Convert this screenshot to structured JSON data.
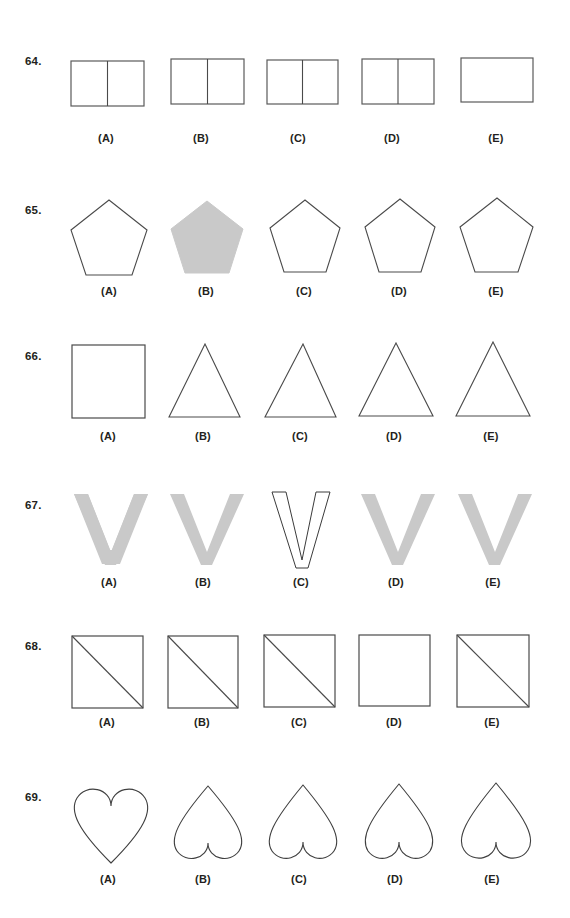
{
  "page": {
    "background_color": "#ffffff",
    "ink_color": "#3a3a3a",
    "fill_gray": "#c9c9c9",
    "text_color": "#231f20",
    "option_labels": [
      "(A)",
      "(B)",
      "(C)",
      "(D)",
      "(E)"
    ]
  },
  "rows": [
    {
      "number": "64.",
      "shape_family": "divided-rectangle",
      "options": [
        {
          "label": "(A)",
          "shape": "rectangle-with-vertical-divider",
          "filled": false
        },
        {
          "label": "(B)",
          "shape": "rectangle-with-vertical-divider",
          "filled": false
        },
        {
          "label": "(C)",
          "shape": "rectangle-with-vertical-divider",
          "filled": false
        },
        {
          "label": "(D)",
          "shape": "rectangle-with-vertical-divider",
          "filled": false
        },
        {
          "label": "(E)",
          "shape": "rectangle-plain",
          "filled": false
        }
      ]
    },
    {
      "number": "65.",
      "shape_family": "pentagon",
      "options": [
        {
          "label": "(A)",
          "shape": "pentagon-outline",
          "filled": false
        },
        {
          "label": "(B)",
          "shape": "pentagon-filled",
          "filled": true
        },
        {
          "label": "(C)",
          "shape": "pentagon-outline",
          "filled": false
        },
        {
          "label": "(D)",
          "shape": "pentagon-outline",
          "filled": false
        },
        {
          "label": "(E)",
          "shape": "pentagon-outline",
          "filled": false
        }
      ]
    },
    {
      "number": "66.",
      "shape_family": "triangle",
      "options": [
        {
          "label": "(A)",
          "shape": "square-outline",
          "filled": false
        },
        {
          "label": "(B)",
          "shape": "triangle-outline",
          "filled": false
        },
        {
          "label": "(C)",
          "shape": "triangle-outline",
          "filled": false
        },
        {
          "label": "(D)",
          "shape": "triangle-outline",
          "filled": false
        },
        {
          "label": "(E)",
          "shape": "triangle-outline",
          "filled": false
        }
      ]
    },
    {
      "number": "67.",
      "shape_family": "letter-v",
      "options": [
        {
          "label": "(A)",
          "shape": "v-filled",
          "filled": true
        },
        {
          "label": "(B)",
          "shape": "v-filled",
          "filled": true
        },
        {
          "label": "(C)",
          "shape": "v-outline-narrow",
          "filled": false
        },
        {
          "label": "(D)",
          "shape": "v-filled",
          "filled": true
        },
        {
          "label": "(E)",
          "shape": "v-filled",
          "filled": true
        }
      ]
    },
    {
      "number": "68.",
      "shape_family": "square-with-diagonal",
      "options": [
        {
          "label": "(A)",
          "shape": "square-with-diagonal",
          "filled": false
        },
        {
          "label": "(B)",
          "shape": "square-with-diagonal",
          "filled": false
        },
        {
          "label": "(C)",
          "shape": "square-with-diagonal",
          "filled": false
        },
        {
          "label": "(D)",
          "shape": "square-plain",
          "filled": false
        },
        {
          "label": "(E)",
          "shape": "square-with-diagonal",
          "filled": false
        }
      ]
    },
    {
      "number": "69.",
      "shape_family": "heart",
      "options": [
        {
          "label": "(A)",
          "shape": "heart-upright",
          "filled": false
        },
        {
          "label": "(B)",
          "shape": "heart-inverted",
          "filled": false
        },
        {
          "label": "(C)",
          "shape": "heart-inverted",
          "filled": false
        },
        {
          "label": "(D)",
          "shape": "heart-inverted",
          "filled": false
        },
        {
          "label": "(E)",
          "shape": "heart-inverted",
          "filled": false
        }
      ]
    }
  ]
}
